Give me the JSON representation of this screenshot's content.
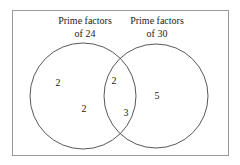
{
  "diagram": {
    "type": "venn",
    "sets": [
      {
        "label_line1": "Prime factors",
        "label_line2": "of 24",
        "only_elements": [
          "2",
          "2"
        ]
      },
      {
        "label_line1": "Prime factors",
        "label_line2": "of 30",
        "only_elements": [
          "5"
        ]
      }
    ],
    "intersection_elements": [
      "2",
      "3"
    ],
    "colors": {
      "border": "#888888",
      "circle": "#444444",
      "text": "#222222"
    }
  }
}
